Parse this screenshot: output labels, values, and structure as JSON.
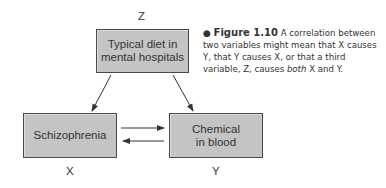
{
  "diagram": {
    "nodes": {
      "z": {
        "label": "Z",
        "text_line1": "Typical diet in",
        "text_line2": "mental hospitals"
      },
      "x": {
        "label": "X",
        "text": "Schizophrenia"
      },
      "y": {
        "label": "Y",
        "text_line1": "Chemical",
        "text_line2": "in blood"
      }
    },
    "edges": [
      {
        "from": "Z",
        "to": "X"
      },
      {
        "from": "Z",
        "to": "Y"
      },
      {
        "from": "X",
        "to": "Y"
      },
      {
        "from": "Y",
        "to": "X"
      }
    ]
  },
  "caption": {
    "bullet": "●",
    "figure_label": "Figure 1.10",
    "text_part1": " A correlation between two variables might mean that X causes Y, that Y causes X, or that a third variable, Z, causes ",
    "emphasis": "both",
    "text_part2": " X and Y."
  }
}
